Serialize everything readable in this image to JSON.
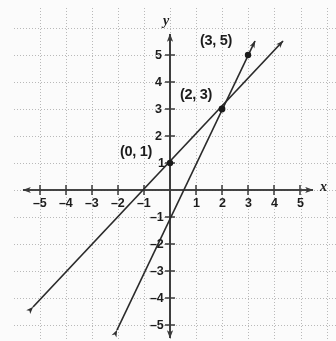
{
  "figure": {
    "axis_x_name": "x",
    "axis_y_name": "y",
    "background_color": "#fbfbfb",
    "grid_color": "#b9b9b9",
    "axis_color": "#3a3a3a",
    "line_color": "#2a2a2a",
    "label_color": "#1c1c1c"
  },
  "ticks": {
    "x": [
      {
        "label": "–5",
        "value": -5
      },
      {
        "label": "–4",
        "value": -4
      },
      {
        "label": "–3",
        "value": -3
      },
      {
        "label": "–2",
        "value": -2
      },
      {
        "label": "–1",
        "value": -1
      },
      {
        "label": "1",
        "value": 1
      },
      {
        "label": "2",
        "value": 2
      },
      {
        "label": "3",
        "value": 3
      },
      {
        "label": "4",
        "value": 4
      },
      {
        "label": "5",
        "value": 5
      }
    ],
    "y": [
      {
        "label": "5",
        "value": 5
      },
      {
        "label": "4",
        "value": 4
      },
      {
        "label": "3",
        "value": 3
      },
      {
        "label": "2",
        "value": 2
      },
      {
        "label": "1",
        "value": 1
      },
      {
        "label": "–1",
        "value": -1
      },
      {
        "label": "–2",
        "value": -2
      },
      {
        "label": "–3",
        "value": -3
      },
      {
        "label": "–4",
        "value": -4
      },
      {
        "label": "–5",
        "value": -5
      }
    ]
  },
  "annotations": [
    {
      "name": "point-label-3-5",
      "text": "(3, 5)",
      "x": 3,
      "y": 5
    },
    {
      "name": "point-label-2-3",
      "text": "(2, 3)",
      "x": 2,
      "y": 3
    },
    {
      "name": "point-label-0-1",
      "text": "(0, 1)",
      "x": 0,
      "y": 1
    }
  ],
  "chart_data": {
    "type": "line",
    "title": "",
    "xlabel": "x",
    "ylabel": "y",
    "xlim": [
      -5.6,
      5.6
    ],
    "ylim": [
      -5.6,
      5.6
    ],
    "grid": true,
    "grid_step": 1,
    "legend": "none",
    "series": [
      {
        "name": "line-slope-1",
        "equation": "y = x + 1",
        "slope": 1,
        "intercept": 1,
        "points": [
          {
            "x": 0,
            "y": 1,
            "marked": true,
            "label": "(0, 1)"
          },
          {
            "x": 2,
            "y": 3,
            "marked": true,
            "label": "(2, 3)"
          }
        ],
        "x_from": -5.3,
        "x_to": 4.3,
        "arrow_start": true,
        "arrow_end": true
      },
      {
        "name": "line-slope-2",
        "equation": "y = 2x - 1",
        "slope": 2,
        "intercept": -1,
        "points": [
          {
            "x": 2,
            "y": 3,
            "marked": true,
            "label": "(2, 3)"
          },
          {
            "x": 3,
            "y": 5,
            "marked": true,
            "label": "(3, 5)"
          }
        ],
        "x_from": -2.05,
        "x_to": 3.25,
        "arrow_start": true,
        "arrow_end": true
      }
    ],
    "intersection": {
      "x": 2,
      "y": 3,
      "label": "(2, 3)"
    },
    "marked_points": [
      {
        "x": 0,
        "y": 1,
        "label": "(0, 1)"
      },
      {
        "x": 2,
        "y": 3,
        "label": "(2, 3)"
      },
      {
        "x": 3,
        "y": 5,
        "label": "(3, 5)"
      }
    ]
  }
}
